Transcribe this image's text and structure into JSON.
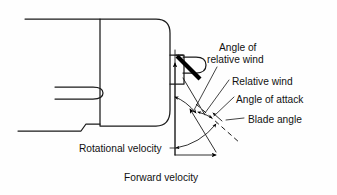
{
  "figure": {
    "background_color": "#fefefe",
    "line_color": "#1a1a1a",
    "text_color": "#111111"
  },
  "labels": {
    "angle_of_relative_wind_line1": "Angle of",
    "angle_of_relative_wind_line2": "relative wind",
    "relative_wind": "Relative wind",
    "angle_of_attack": "Angle of attack",
    "blade_angle": "Blade angle",
    "rotational_velocity": "Rotational velocity",
    "forward_velocity": "Forward velocity"
  },
  "parts": {
    "nacelle": "engine-nacelle-outline",
    "blade": "propeller-blade-section",
    "hub": "blade-hub-mount",
    "chord_extension": "chord-line-dashed",
    "origin": "velocity-vector-origin"
  },
  "geometry": {
    "canvas_width": 337,
    "canvas_height": 195,
    "origin_point": [
      175,
      155
    ],
    "forward_velocity_arrow_end": [
      219,
      155
    ],
    "rotational_velocity_arrow_end": [
      175,
      62
    ],
    "relative_wind_arrow_end": [
      205,
      118
    ],
    "blade_pivot": [
      180,
      62
    ]
  }
}
